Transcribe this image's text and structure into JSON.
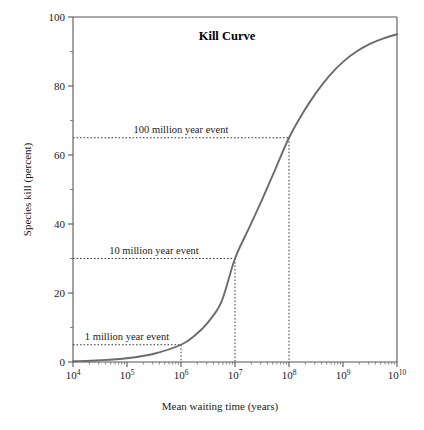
{
  "figure": {
    "title": "Kill Curve",
    "xlabel": "Mean waiting time (years)",
    "ylabel": "Species kill (percent)",
    "curve_color": "#6b6b6b",
    "axis_color": "#555555",
    "guide_color": "#3a3a3a",
    "background": "#ffffff"
  },
  "xticks": [
    {
      "base": "10",
      "exp": "4",
      "value": 10000
    },
    {
      "base": "10",
      "exp": "5",
      "value": 100000
    },
    {
      "base": "10",
      "exp": "6",
      "value": 1000000
    },
    {
      "base": "10",
      "exp": "7",
      "value": 10000000
    },
    {
      "base": "10",
      "exp": "8",
      "value": 100000000
    },
    {
      "base": "10",
      "exp": "9",
      "value": 1000000000
    },
    {
      "base": "10",
      "exp": "10",
      "value": 10000000000
    }
  ],
  "yticks_major": [
    "0",
    "20",
    "40",
    "60",
    "80",
    "100"
  ],
  "yticks_minor": [
    10,
    30,
    50,
    70,
    90
  ],
  "annotations": [
    {
      "label": "1 million year event",
      "x_value": 1000000,
      "y_value": 5
    },
    {
      "label": "10 million year event",
      "x_value": 10000000,
      "y_value": 30
    },
    {
      "label": "100 million year event",
      "x_value": 100000000,
      "y_value": 65
    }
  ],
  "chart_data": {
    "type": "line",
    "title": "Kill Curve",
    "xlabel": "Mean waiting time (years)",
    "ylabel": "Species kill (percent)",
    "xscale": "log",
    "xlim": [
      10000,
      10000000000
    ],
    "ylim": [
      0,
      100
    ],
    "grid": false,
    "legend": "none",
    "series": [
      {
        "name": "Kill curve",
        "x": [
          10000,
          31623,
          100000,
          316228,
          1000000,
          1778279,
          3162278,
          5623413,
          10000000,
          17782794,
          31622777,
          56234133,
          100000000,
          177827941,
          316227766,
          562341325,
          1000000000,
          1778279410,
          3162277660,
          5623413252,
          10000000000
        ],
        "y": [
          0.2,
          0.5,
          1.1,
          2.4,
          5.0,
          7.6,
          11.5,
          17.5,
          30.0,
          38.5,
          47.0,
          56.0,
          65.0,
          72.0,
          78.0,
          83.0,
          87.0,
          90.0,
          92.2,
          93.8,
          95.0
        ]
      }
    ],
    "annotations": [
      {
        "text": "1 million year event",
        "x": 1000000,
        "y": 5
      },
      {
        "text": "10 million year event",
        "x": 10000000,
        "y": 30
      },
      {
        "text": "100 million year event",
        "x": 100000000,
        "y": 65
      }
    ]
  }
}
